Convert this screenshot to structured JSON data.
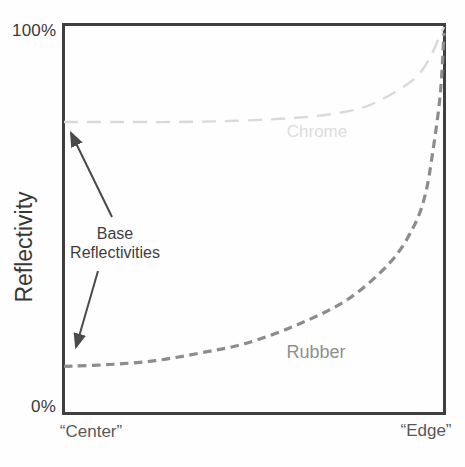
{
  "figure": {
    "y_axis_label": "Reflectivity",
    "y_tick_top": "100%",
    "y_tick_bottom": "0%",
    "x_tick_left": "“Center”",
    "x_tick_right": "“Edge”",
    "annotation_line1": "Base",
    "annotation_line2": "Reflectivities"
  },
  "colors": {
    "axis_frame": "#3f3f3f",
    "tick_text": "#3a3a3a",
    "x_tick_text": "#585858",
    "annotation_text": "#3f3f3f",
    "arrow": "#4a4a4a",
    "chrome_curve": "#d9d9d9",
    "chrome_label": "#dcdcdc",
    "rubber_curve": "#8c8c8c",
    "rubber_label": "#8f8f8f",
    "background": "#fefefe"
  },
  "chart_data": {
    "type": "line",
    "title": "",
    "xlabel": "",
    "ylabel": "Reflectivity",
    "x_tick_labels": [
      "“Center”",
      "“Edge”"
    ],
    "y_tick_labels": [
      "0%",
      "100%"
    ],
    "xlim": [
      0,
      1
    ],
    "ylim": [
      0,
      100
    ],
    "grid": false,
    "legend_position": "inline-labels",
    "line_style": "dashed",
    "annotations": [
      {
        "text": "Base Reflectivities",
        "meaning": "arrows point to each curve's reflectivity value at the center (0 degree incidence)",
        "points_to": [
          {
            "series": "Chrome",
            "x": 0,
            "y": 75
          },
          {
            "series": "Rubber",
            "x": 0,
            "y": 12
          }
        ]
      }
    ],
    "series": [
      {
        "name": "Chrome",
        "color": "#d9d9d9",
        "label_color": "#dcdcdc",
        "base_reflectivity_pct": 75,
        "x": [
          0,
          0.15,
          0.3,
          0.45,
          0.6,
          0.7,
          0.78,
          0.84,
          0.9,
          0.94,
          0.97,
          0.99,
          1.0
        ],
        "y": [
          75,
          75,
          75,
          75.3,
          76,
          77,
          78.5,
          81,
          84.5,
          88,
          93,
          97.5,
          99.5
        ]
      },
      {
        "name": "Rubber",
        "color": "#8c8c8c",
        "label_color": "#8f8f8f",
        "base_reflectivity_pct": 12,
        "x": [
          0,
          0.12,
          0.24,
          0.36,
          0.48,
          0.62,
          0.75,
          0.86,
          0.92,
          0.95,
          0.97,
          0.99,
          1.0
        ],
        "y": [
          12,
          12.5,
          13.5,
          15.5,
          18,
          23,
          29.5,
          39,
          48,
          56,
          67,
          82,
          98
        ]
      }
    ]
  }
}
